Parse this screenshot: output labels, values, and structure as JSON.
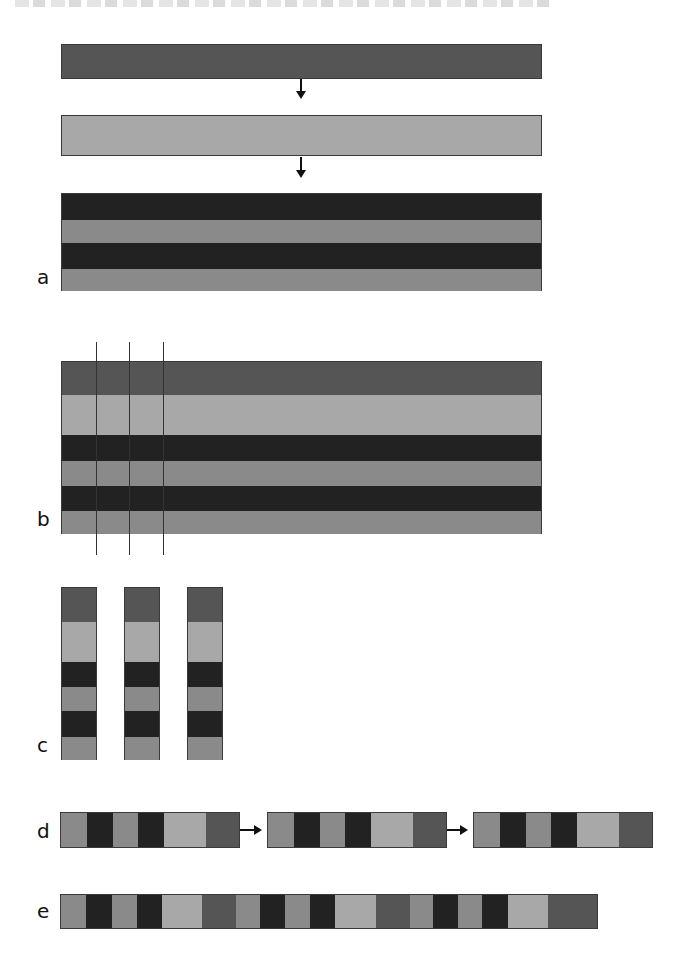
{
  "colors": {
    "mid_dark": "#555555",
    "light": "#a8a8a8",
    "dark": "#222222",
    "gray": "#8a8a8a"
  },
  "panels": {
    "a": {
      "label": "a",
      "steps": [
        "single mid-dark layer",
        "single light layer",
        "stack: dark / gray / dark / gray"
      ]
    },
    "b": {
      "label": "b",
      "layers": [
        "mid_dark",
        "light",
        "dark",
        "gray",
        "dark",
        "gray"
      ],
      "cut_lines": 3
    },
    "c": {
      "label": "c",
      "columns": 3,
      "layers": [
        "mid_dark",
        "light",
        "dark",
        "gray",
        "dark",
        "gray"
      ]
    },
    "d": {
      "label": "d",
      "segments": 3,
      "segment_pattern": [
        "gray",
        "dark",
        "gray",
        "dark",
        "light",
        "mid_dark"
      ]
    },
    "e": {
      "label": "e",
      "repeats": 3,
      "segment_pattern": [
        "gray",
        "dark",
        "gray",
        "dark",
        "light",
        "mid_dark"
      ]
    }
  }
}
